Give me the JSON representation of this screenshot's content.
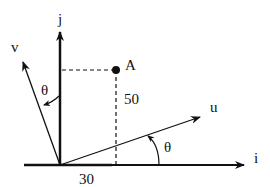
{
  "diagram": {
    "axes": {
      "i_label": "i",
      "j_label": "j",
      "u_label": "u",
      "v_label": "v"
    },
    "point": {
      "label": "A",
      "x_value": "30",
      "y_value": "50"
    },
    "angles": {
      "u_angle_label": "θ",
      "v_angle_label": "θ"
    },
    "colors": {
      "stroke": "#111111",
      "background": "#ffffff"
    }
  }
}
